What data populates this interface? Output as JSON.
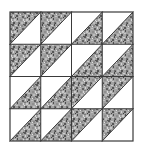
{
  "figure": {
    "title": "Quilt Block Diagram",
    "kind": "quilt-block",
    "description": "Four-by-four grid of half-square triangles forming a rotating pinwheel star",
    "background_color": "#ffffff"
  },
  "canvas": {
    "width": 143,
    "height": 150
  },
  "block": {
    "x": 10,
    "y": 12,
    "width": 123,
    "height": 129,
    "grid_rows": 4,
    "grid_cols": 4,
    "outline_color": "#3a3a3a",
    "outline_width": 1.2,
    "seam_color": "#3a3a3a",
    "seam_width": 1.0
  },
  "fabrics": {
    "print": {
      "name": "mottled-gray-print",
      "base_color": "#9a9a9a",
      "speckle_dark": "#4f4f4f",
      "speckle_mid": "#7d7d7d",
      "speckle_light": "#c9c9c9"
    },
    "solid": {
      "name": "white-solid",
      "base_color": "#ffffff"
    }
  },
  "units": [
    {
      "row": 0,
      "col": 0,
      "type": "half-square-triangle",
      "diagonal": "tl-br",
      "print_side": "upper-left"
    },
    {
      "row": 0,
      "col": 1,
      "type": "half-square-triangle",
      "diagonal": "tl-br",
      "print_side": "upper-left"
    },
    {
      "row": 0,
      "col": 2,
      "type": "half-square-triangle",
      "diagonal": "tr-bl",
      "print_side": "lower-right"
    },
    {
      "row": 0,
      "col": 3,
      "type": "half-square-triangle",
      "diagonal": "tr-bl",
      "print_side": "lower-right"
    },
    {
      "row": 1,
      "col": 0,
      "type": "half-square-triangle",
      "diagonal": "tl-br",
      "print_side": "upper-left"
    },
    {
      "row": 1,
      "col": 1,
      "type": "half-square-triangle",
      "diagonal": "tl-br",
      "print_side": "upper-left"
    },
    {
      "row": 1,
      "col": 2,
      "type": "half-square-triangle",
      "diagonal": "tr-bl",
      "print_side": "lower-right"
    },
    {
      "row": 1,
      "col": 3,
      "type": "half-square-triangle",
      "diagonal": "tr-bl",
      "print_side": "lower-right"
    },
    {
      "row": 2,
      "col": 0,
      "type": "half-square-triangle",
      "diagonal": "tr-bl",
      "print_side": "lower-right"
    },
    {
      "row": 2,
      "col": 1,
      "type": "half-square-triangle",
      "diagonal": "tr-bl",
      "print_side": "lower-right"
    },
    {
      "row": 2,
      "col": 2,
      "type": "half-square-triangle",
      "diagonal": "tl-br",
      "print_side": "upper-left"
    },
    {
      "row": 2,
      "col": 3,
      "type": "half-square-triangle",
      "diagonal": "tl-br",
      "print_side": "upper-left"
    },
    {
      "row": 3,
      "col": 0,
      "type": "half-square-triangle",
      "diagonal": "tr-bl",
      "print_side": "lower-right"
    },
    {
      "row": 3,
      "col": 1,
      "type": "half-square-triangle",
      "diagonal": "tr-bl",
      "print_side": "lower-right"
    },
    {
      "row": 3,
      "col": 2,
      "type": "half-square-triangle",
      "diagonal": "tl-br",
      "print_side": "upper-left"
    },
    {
      "row": 3,
      "col": 3,
      "type": "half-square-triangle",
      "diagonal": "tl-br",
      "print_side": "upper-left"
    }
  ]
}
